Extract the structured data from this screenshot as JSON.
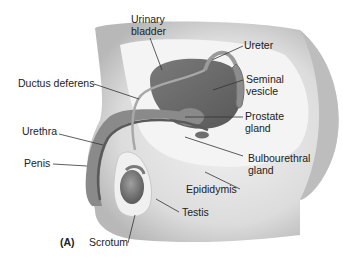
{
  "figure": {
    "panel_label": "(A)"
  },
  "labels": {
    "urinary_bladder": "Urinary\nbladder",
    "ureter": "Ureter",
    "ductus_deferens": "Ductus deferens",
    "seminal_vesicle": "Seminal\nvesicle",
    "prostate_gland": "Prostate\ngland",
    "urethra": "Urethra",
    "bulbourethral_gland": "Bulbourethral\ngland",
    "penis": "Penis",
    "epididymis": "Epididymis",
    "testis": "Testis",
    "scrotum": "Scrotum"
  },
  "colors": {
    "body_light": "#e6e6e6",
    "body_shadow": "#bdbdbd",
    "organ_dark": "#6e6e6e",
    "organ_mid": "#8c8c8c",
    "leader_line": "#333333",
    "text": "#222222"
  }
}
